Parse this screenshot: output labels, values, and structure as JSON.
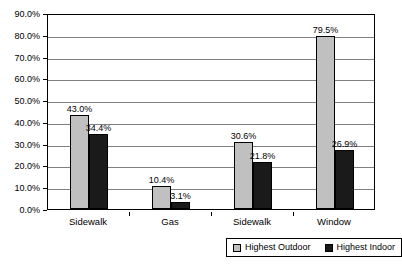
{
  "chart_data": {
    "type": "bar",
    "title": "",
    "subtitle": "",
    "xlabel": "",
    "ylabel": "",
    "categories": [
      "Sidewalk",
      "Gas",
      "Sidewalk",
      "Window"
    ],
    "series": [
      {
        "name": "Highest Outdoor",
        "color": "#c0c0c0",
        "values": [
          43.0,
          10.4,
          30.6,
          79.5
        ],
        "labels": [
          "43.0%",
          "10.4%",
          "30.6%",
          "79.5%"
        ]
      },
      {
        "name": "Highest Indoor",
        "color": "#1a1a1a",
        "values": [
          34.4,
          3.1,
          21.8,
          26.9
        ],
        "labels": [
          "34.4%",
          "3.1%",
          "21.8%",
          "26.9%"
        ]
      }
    ],
    "ylim": [
      0,
      90
    ],
    "ytick_values": [
      0,
      10,
      20,
      30,
      40,
      50,
      60,
      70,
      80,
      90
    ],
    "ytick_labels": [
      "0.0%",
      "10.0%",
      "20.0%",
      "30.0%",
      "40.0%",
      "50.0%",
      "60.0%",
      "70.0%",
      "80.0%",
      "90.0%"
    ],
    "grid": true,
    "grid_axis": "y",
    "legend_position": "bottom-right",
    "legend_entries": [
      "Highest Outdoor",
      "Highest Indoor"
    ],
    "data_labels_shown": true,
    "plot_border": true,
    "background": "#ffffff"
  }
}
